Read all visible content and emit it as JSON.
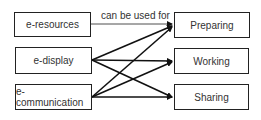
{
  "diagram": {
    "sources": [
      {
        "id": "e-resources",
        "label": "e-resources"
      },
      {
        "id": "e-display",
        "label": "e-display"
      },
      {
        "id": "e-communication",
        "label": "e-communication"
      }
    ],
    "targets": [
      {
        "id": "preparing",
        "label": "Preparing"
      },
      {
        "id": "working",
        "label": "Working"
      },
      {
        "id": "sharing",
        "label": "Sharing"
      }
    ],
    "edge_label": "can be used for",
    "edges": [
      {
        "from": "e-resources",
        "to": "preparing",
        "style": "thin"
      },
      {
        "from": "e-display",
        "to": "preparing",
        "style": "thick"
      },
      {
        "from": "e-display",
        "to": "working",
        "style": "thick"
      },
      {
        "from": "e-display",
        "to": "sharing",
        "style": "thick"
      },
      {
        "from": "e-communication",
        "to": "preparing",
        "style": "thick"
      },
      {
        "from": "e-communication",
        "to": "working",
        "style": "thick"
      },
      {
        "from": "e-communication",
        "to": "sharing",
        "style": "thick"
      }
    ]
  }
}
